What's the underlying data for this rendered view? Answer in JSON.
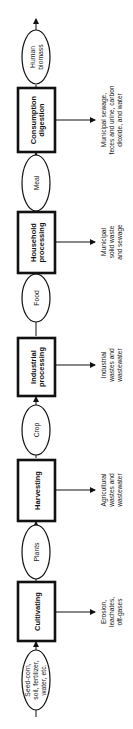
{
  "diagram": {
    "processes": [
      {
        "id": "cultivating",
        "lines": [
          "Cultivating"
        ],
        "output": [
          "Erosion,",
          "leachates,",
          "off-gases"
        ]
      },
      {
        "id": "harvesting",
        "lines": [
          "Harvesting"
        ],
        "output": [
          "Agricultural",
          "wastes and",
          "wastewater"
        ]
      },
      {
        "id": "industrial",
        "lines": [
          "Industrial",
          "processing"
        ],
        "output": [
          "Industrial",
          "wastes and",
          "wastewater"
        ]
      },
      {
        "id": "household",
        "lines": [
          "Household",
          "processing"
        ],
        "output": [
          "Municipal",
          "solid waste",
          "and sewage"
        ]
      },
      {
        "id": "consumption",
        "lines": [
          "Consumption",
          "digestion"
        ],
        "output": [
          "Municipal sewage,",
          "feces and urine, carbon",
          "dioxide, and water"
        ]
      }
    ],
    "flows": [
      {
        "id": "inputs",
        "lines": [
          "Seed-corn,",
          "soil, fertilizer,",
          "water, etc."
        ]
      },
      {
        "id": "plants",
        "lines": [
          "Plants"
        ]
      },
      {
        "id": "crop",
        "lines": [
          "Crop"
        ]
      },
      {
        "id": "food",
        "lines": [
          "Food"
        ]
      },
      {
        "id": "meal",
        "lines": [
          "Meal"
        ]
      },
      {
        "id": "human-biomass",
        "lines": [
          "Human",
          "biomass"
        ]
      }
    ]
  }
}
